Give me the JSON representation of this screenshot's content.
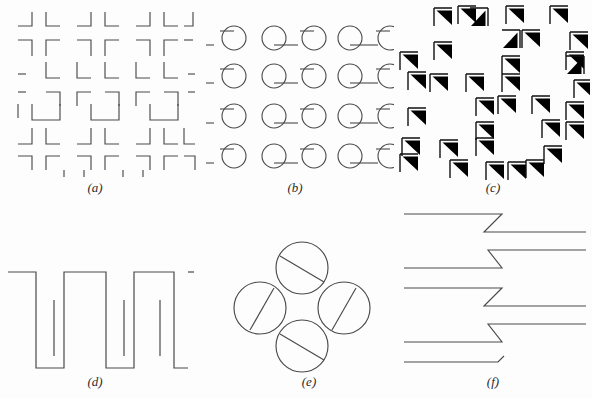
{
  "figure": {
    "background_color": "#fdfdfd",
    "stroke_color": "#4a4a4a",
    "fill_color": "#000000",
    "width": 592,
    "height": 399,
    "panels": [
      {
        "id": "a",
        "label": "(a)",
        "description": "Grid of right-angle corner brackets forming illusory squares",
        "type": "corner-bracket-grid",
        "rows": 5,
        "cols": 6,
        "element": "L-corner"
      },
      {
        "id": "b",
        "label": "(b)",
        "description": "Array of circles with tangent line segments",
        "type": "circle-tangent-grid",
        "rows": 4,
        "cols": 5,
        "element": "circle-with-tangent-line"
      },
      {
        "id": "c",
        "label": "(c)",
        "description": "Randomly oriented solid black right triangles with thin corner brackets",
        "type": "random-triangle-field",
        "count": 34,
        "element": "black-right-triangle"
      },
      {
        "id": "d",
        "label": "(d)",
        "description": "Square-wave comb contour with interleaved vertical strokes",
        "type": "square-wave-comb",
        "teeth": 3,
        "element": "square-wave"
      },
      {
        "id": "e",
        "label": "(e)",
        "description": "Four circles arranged in a diamond, each bisected by a chord",
        "type": "circle-chord-diamond",
        "count": 4,
        "element": "circle-with-chord"
      },
      {
        "id": "f",
        "label": "(f)",
        "description": "Horizontal lines joined by central zigzag offsets",
        "type": "zigzag-offset-lines",
        "lines": 9,
        "element": "horizontal-line-with-zigzag"
      }
    ]
  }
}
